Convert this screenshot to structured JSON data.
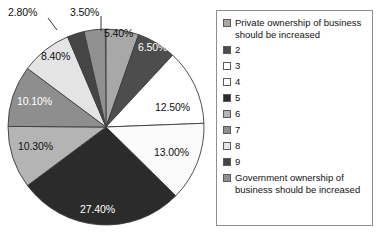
{
  "chart_data": {
    "type": "pie",
    "title": "",
    "subtitle": "",
    "xlabel": "",
    "ylabel": "",
    "grid": false,
    "legend_position": "right",
    "start_angle_deg": 0,
    "direction": "clockwise",
    "total": 100.0,
    "categories": [
      "Private ownership of business should be increased",
      "2",
      "3",
      "4",
      "5",
      "6",
      "7",
      "8",
      "9",
      "Government ownership of business should be increased"
    ],
    "values": [
      5.4,
      6.5,
      12.5,
      13.0,
      27.4,
      10.3,
      10.1,
      8.4,
      2.8,
      3.5
    ],
    "data_labels": [
      "5.40%",
      "6.50%",
      "12.50%",
      "13.00%",
      "27.40%",
      "10.30%",
      "10.10%",
      "8.40%",
      "2.80%",
      "3.50%"
    ],
    "colors": [
      "#a8a8a8",
      "#4d4d4d",
      "#ffffff",
      "#fbfbfb",
      "#2b2b2b",
      "#b4b4b4",
      "#8e8e8e",
      "#e4e4e4",
      "#454545",
      "#909090"
    ],
    "slice_outline_color": "#3c3c3c",
    "label_outside": [
      "2.80%",
      "3.50%"
    ]
  },
  "legend": {
    "items": [
      {
        "label": "Private ownership of business should be increased",
        "swatch": "#a8a8a8"
      },
      {
        "label": "2",
        "swatch": "#4d4d4d"
      },
      {
        "label": "3",
        "swatch": "#ffffff"
      },
      {
        "label": "4",
        "swatch": "#fbfbfb"
      },
      {
        "label": "5",
        "swatch": "#2b2b2b"
      },
      {
        "label": "6",
        "swatch": "#b4b4b4"
      },
      {
        "label": "7",
        "swatch": "#8e8e8e"
      },
      {
        "label": "8",
        "swatch": "#e4e4e4"
      },
      {
        "label": "9",
        "swatch": "#454545"
      },
      {
        "label": "Government ownership of business should be increased",
        "swatch": "#909090"
      }
    ]
  }
}
